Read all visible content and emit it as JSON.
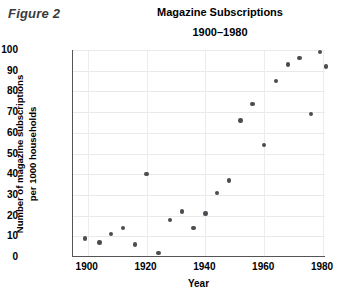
{
  "figure": {
    "label": "Figure 2"
  },
  "chart_data": {
    "type": "scatter",
    "title": "Magazine Subscriptions",
    "subtitle": "1900–1980",
    "xlabel": "Year",
    "ylabel_line1": "Number of magazine subscriptions",
    "ylabel_line2": "per 1000 households",
    "xlim": [
      1895,
      1981
    ],
    "ylim": [
      0,
      100
    ],
    "xticks": [
      1900,
      1920,
      1940,
      1960,
      1980
    ],
    "xtick_labels": [
      "1900",
      "1920",
      "1940",
      "1960",
      "1980"
    ],
    "yticks": [
      0,
      10,
      20,
      30,
      40,
      50,
      60,
      70,
      80,
      90,
      100
    ],
    "ytick_labels": [
      "0",
      "10",
      "20",
      "30",
      "40",
      "50",
      "60",
      "70",
      "80",
      "90",
      "100"
    ],
    "grid": true,
    "legend": null,
    "marker_color": "#4c4c52",
    "points": [
      {
        "x": 1899,
        "y": 9
      },
      {
        "x": 1904,
        "y": 7
      },
      {
        "x": 1908,
        "y": 11
      },
      {
        "x": 1912,
        "y": 14
      },
      {
        "x": 1916,
        "y": 6
      },
      {
        "x": 1920,
        "y": 40
      },
      {
        "x": 1924,
        "y": 2
      },
      {
        "x": 1928,
        "y": 18
      },
      {
        "x": 1932,
        "y": 22
      },
      {
        "x": 1936,
        "y": 14
      },
      {
        "x": 1940,
        "y": 21
      },
      {
        "x": 1944,
        "y": 31
      },
      {
        "x": 1948,
        "y": 37
      },
      {
        "x": 1952,
        "y": 66
      },
      {
        "x": 1956,
        "y": 74
      },
      {
        "x": 1960,
        "y": 54
      },
      {
        "x": 1964,
        "y": 85
      },
      {
        "x": 1968,
        "y": 93
      },
      {
        "x": 1972,
        "y": 96
      },
      {
        "x": 1976,
        "y": 69
      },
      {
        "x": 1979,
        "y": 99
      },
      {
        "x": 1981,
        "y": 92
      }
    ]
  }
}
